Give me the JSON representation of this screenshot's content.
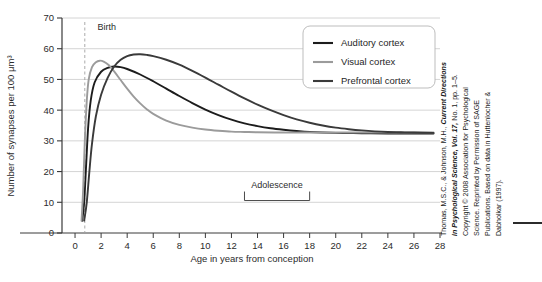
{
  "chart_data": {
    "type": "line",
    "title": "",
    "xlabel": "Age in years from conception",
    "ylabel": "Number of synapses per 100 μm³",
    "xlim": [
      -1,
      28
    ],
    "ylim": [
      0,
      70
    ],
    "xticks": [
      0,
      2,
      4,
      6,
      8,
      10,
      12,
      14,
      16,
      18,
      20,
      22,
      24,
      26,
      28
    ],
    "yticks": [
      0,
      10,
      20,
      30,
      40,
      50,
      60,
      70
    ],
    "grid": "horizontal",
    "legend_position": "top-right",
    "series": [
      {
        "name": "Auditory cortex",
        "color": "#1c1c1c",
        "points": [
          [
            0.55,
            4
          ],
          [
            0.7,
            10
          ],
          [
            0.85,
            22
          ],
          [
            1.0,
            34
          ],
          [
            1.2,
            43
          ],
          [
            1.5,
            49
          ],
          [
            2.0,
            52.5
          ],
          [
            2.5,
            53.8
          ],
          [
            3.0,
            54.2
          ],
          [
            3.5,
            54.0
          ],
          [
            4.0,
            53.4
          ],
          [
            5.0,
            51.6
          ],
          [
            6.0,
            49.4
          ],
          [
            7.0,
            47.0
          ],
          [
            8.0,
            44.6
          ],
          [
            9.0,
            42.3
          ],
          [
            10.0,
            40.2
          ],
          [
            11.0,
            38.4
          ],
          [
            12.0,
            36.9
          ],
          [
            13.0,
            35.7
          ],
          [
            14.0,
            34.8
          ],
          [
            15.0,
            34.1
          ],
          [
            16.0,
            33.6
          ],
          [
            17.0,
            33.2
          ],
          [
            18.0,
            32.9
          ],
          [
            20.0,
            32.6
          ],
          [
            22.0,
            32.5
          ],
          [
            24.0,
            32.4
          ],
          [
            26.0,
            32.4
          ],
          [
            27.5,
            32.4
          ]
        ]
      },
      {
        "name": "Visual cortex",
        "color": "#9b9b9b",
        "points": [
          [
            0.5,
            4
          ],
          [
            0.62,
            14
          ],
          [
            0.75,
            30
          ],
          [
            0.9,
            43
          ],
          [
            1.05,
            50
          ],
          [
            1.3,
            54
          ],
          [
            1.6,
            55.6
          ],
          [
            1.9,
            56.1
          ],
          [
            2.2,
            55.8
          ],
          [
            2.6,
            54.6
          ],
          [
            3.0,
            52.6
          ],
          [
            3.5,
            49.8
          ],
          [
            4.0,
            47.0
          ],
          [
            4.5,
            44.4
          ],
          [
            5.0,
            42.2
          ],
          [
            5.5,
            40.3
          ],
          [
            6.0,
            38.8
          ],
          [
            7.0,
            36.6
          ],
          [
            8.0,
            35.2
          ],
          [
            9.0,
            34.3
          ],
          [
            10.0,
            33.7
          ],
          [
            11.0,
            33.3
          ],
          [
            12.0,
            33.0
          ],
          [
            13.0,
            32.9
          ],
          [
            14.0,
            32.8
          ],
          [
            16.0,
            32.7
          ],
          [
            18.0,
            32.7
          ],
          [
            20.0,
            32.7
          ],
          [
            23.0,
            32.7
          ],
          [
            27.5,
            32.7
          ]
        ]
      },
      {
        "name": "Prefrontal cortex",
        "color": "#3a3a3a",
        "points": [
          [
            0.7,
            4
          ],
          [
            0.9,
            10
          ],
          [
            1.1,
            20
          ],
          [
            1.3,
            29
          ],
          [
            1.6,
            38
          ],
          [
            2.0,
            45
          ],
          [
            2.5,
            50.5
          ],
          [
            3.0,
            54.2
          ],
          [
            3.5,
            56.4
          ],
          [
            4.0,
            57.6
          ],
          [
            4.5,
            58.1
          ],
          [
            5.0,
            58.2
          ],
          [
            5.5,
            58.0
          ],
          [
            6.0,
            57.6
          ],
          [
            7.0,
            56.4
          ],
          [
            8.0,
            54.8
          ],
          [
            9.0,
            52.8
          ],
          [
            10.0,
            50.6
          ],
          [
            11.0,
            48.3
          ],
          [
            12.0,
            46.0
          ],
          [
            13.0,
            43.8
          ],
          [
            14.0,
            41.8
          ],
          [
            15.0,
            40.0
          ],
          [
            16.0,
            38.4
          ],
          [
            17.0,
            37.0
          ],
          [
            18.0,
            35.9
          ],
          [
            19.0,
            35.0
          ],
          [
            20.0,
            34.3
          ],
          [
            21.0,
            33.8
          ],
          [
            22.0,
            33.4
          ],
          [
            23.0,
            33.1
          ],
          [
            24.0,
            32.9
          ],
          [
            25.0,
            32.8
          ],
          [
            26.0,
            32.7
          ],
          [
            27.5,
            32.6
          ]
        ]
      }
    ],
    "annotations": [
      {
        "name": "birth-marker",
        "label": "Birth",
        "x": 0.75,
        "type": "vline-dashed"
      },
      {
        "name": "adolescence-bracket",
        "label": "Adolescence",
        "x_start": 13.0,
        "x_end": 18.0,
        "y": 13.5,
        "type": "bracket"
      }
    ]
  },
  "legend": {
    "items": [
      {
        "label": "Auditory cortex",
        "color": "#1c1c1c"
      },
      {
        "label": "Visual cortex",
        "color": "#9b9b9b"
      },
      {
        "label": "Prefrontal cortex",
        "color": "#3a3a3a"
      }
    ]
  },
  "axes": {
    "y_label": "Number of synapses per 100 μm³",
    "x_label": "Age in years from conception",
    "y_ticks": [
      "0",
      "10",
      "20",
      "30",
      "40",
      "50",
      "60",
      "70"
    ],
    "x_ticks": [
      "0",
      "2",
      "4",
      "6",
      "8",
      "10",
      "12",
      "14",
      "16",
      "18",
      "20",
      "22",
      "24",
      "26",
      "28"
    ]
  },
  "annotations": {
    "birth": "Birth",
    "adolescence": "Adolescence"
  },
  "credit": {
    "lines": [
      "Thomas, M.S.C., & Johnson, M.H., Current Directions",
      "in Psychological Science, Vol. 17, No. 1, pp. 1–5.",
      "Copyright © 2008 Association for Psychological",
      "Science. Reprinted by Permission of SAGE",
      "Publications. Based on data in Huttenlocher &",
      "Dabholkar (1997)."
    ]
  }
}
